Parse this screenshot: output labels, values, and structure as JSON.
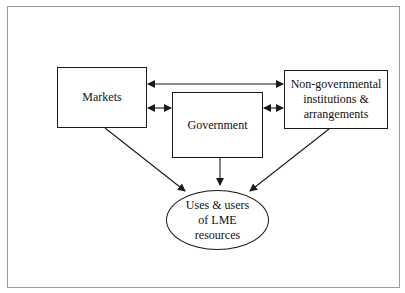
{
  "diagram": {
    "nodes": {
      "markets": {
        "label": "Markets"
      },
      "government": {
        "label": "Government"
      },
      "ngo": {
        "lines": [
          "Non-governmental",
          "institutions &",
          "arrangements"
        ]
      },
      "uses": {
        "lines": [
          "Uses & users",
          "of LME",
          "resources"
        ]
      }
    },
    "edges": [
      {
        "from": "markets",
        "to": "ngo",
        "type": "bidirectional"
      },
      {
        "from": "markets",
        "to": "government",
        "type": "bidirectional"
      },
      {
        "from": "government",
        "to": "ngo",
        "type": "bidirectional"
      },
      {
        "from": "markets",
        "to": "uses",
        "type": "directed"
      },
      {
        "from": "government",
        "to": "uses",
        "type": "directed"
      },
      {
        "from": "ngo",
        "to": "uses",
        "type": "directed"
      }
    ],
    "colors": {
      "line": "#1a1a1a",
      "frame": "#9a9a9a",
      "background": "#ffffff"
    }
  }
}
